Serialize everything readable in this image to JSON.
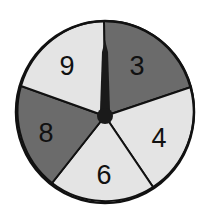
{
  "spinner": {
    "sections": [
      {
        "label": "3",
        "shade": "dark"
      },
      {
        "label": "4",
        "shade": "light"
      },
      {
        "label": "6",
        "shade": "light"
      },
      {
        "label": "8",
        "shade": "dark"
      },
      {
        "label": "9",
        "shade": "light"
      }
    ],
    "colors": {
      "dark": "#6b6b6b",
      "light": "#e4e4e4",
      "outline": "#111111",
      "pointer": "#1a1a1a"
    }
  }
}
